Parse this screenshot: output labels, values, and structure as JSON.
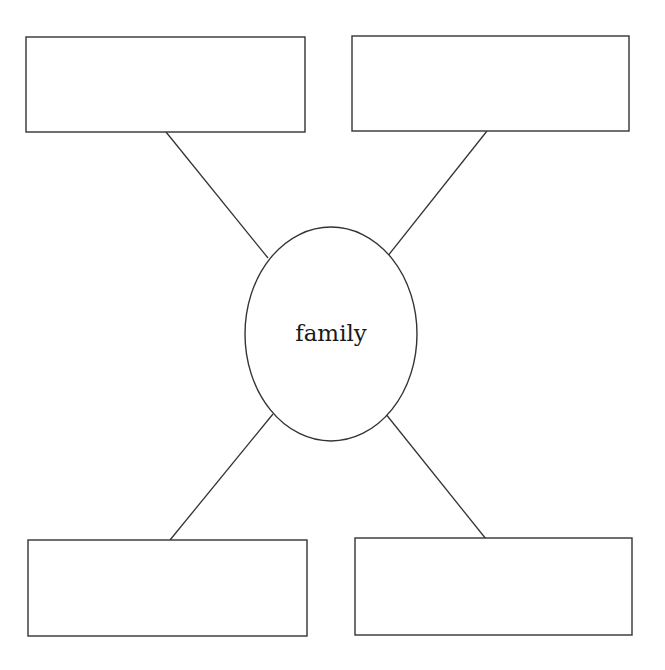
{
  "diagram": {
    "type": "concept-web",
    "center": {
      "label": "family",
      "shape": "ellipse"
    },
    "boxes": [
      {
        "id": "top-left",
        "text": ""
      },
      {
        "id": "top-right",
        "text": ""
      },
      {
        "id": "bottom-left",
        "text": ""
      },
      {
        "id": "bottom-right",
        "text": ""
      }
    ],
    "colors": {
      "stroke": "#333333",
      "background": "#ffffff"
    }
  }
}
